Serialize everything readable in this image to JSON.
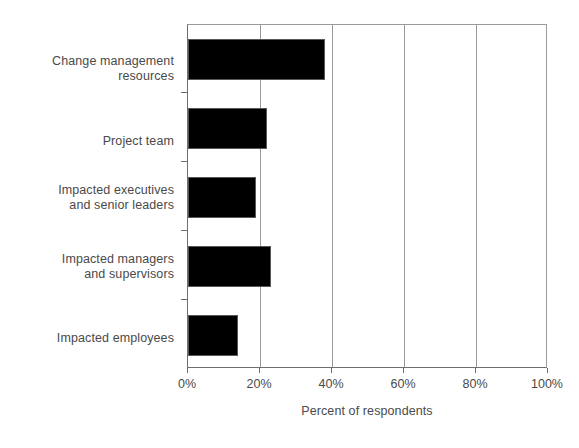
{
  "chart_data": {
    "type": "bar",
    "orientation": "horizontal",
    "title": "",
    "subtitle": "",
    "xlabel": "Percent of respondents",
    "ylabel": "",
    "categories": [
      "Change management resources",
      "Project team",
      "Impacted executives and senior leaders",
      "Impacted managers and supervisors",
      "Impacted employees"
    ],
    "values": [
      38,
      22,
      19,
      23,
      14
    ],
    "xlim": [
      0,
      100
    ],
    "xticks": [
      0,
      20,
      40,
      60,
      80,
      100
    ],
    "xticklabels": [
      "0%",
      "20%",
      "40%",
      "60%",
      "80%",
      "100%"
    ],
    "grid": "vertical",
    "legend": "none",
    "bar_color": "#000000",
    "axis_color": "#6e6e6e",
    "grid_color": "#9a9a9a",
    "background": "#ffffff"
  },
  "axis": {
    "x_title": "Percent of respondents"
  },
  "categories": [
    {
      "line1": "Change management",
      "line2": "resources"
    },
    {
      "line1": "Project team",
      "line2": ""
    },
    {
      "line1": "Impacted executives",
      "line2": "and senior leaders"
    },
    {
      "line1": "Impacted managers",
      "line2": "and supervisors"
    },
    {
      "line1": "Impacted employees",
      "line2": ""
    }
  ],
  "ticks": [
    {
      "label": "0%",
      "value": 0
    },
    {
      "label": "20%",
      "value": 20
    },
    {
      "label": "40%",
      "value": 40
    },
    {
      "label": "60%",
      "value": 60
    },
    {
      "label": "80%",
      "value": 80
    },
    {
      "label": "100%",
      "value": 100
    }
  ]
}
